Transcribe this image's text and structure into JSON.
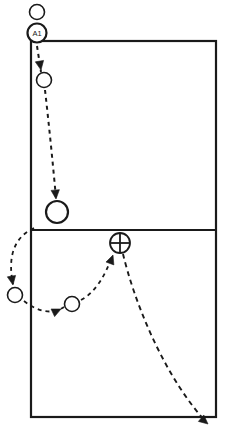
{
  "diagram": {
    "type": "court-play-diagram",
    "colors": {
      "line": "#1a1a1a",
      "fill": "#ffffff",
      "background": "#ffffff"
    },
    "court": {
      "name": "court-outline",
      "left": 31,
      "top": 41,
      "right": 216,
      "bottom": 417,
      "stroke_width": 2.2,
      "net_line_y": 230,
      "net_line_label": ""
    },
    "labels": [
      {
        "name": "player-label-a1",
        "text": "A1",
        "x": 37,
        "y": 33,
        "size": 7.5
      }
    ],
    "markers": [
      {
        "name": "player-start-marker-top",
        "shape": "circle-open",
        "x": 37,
        "y": 12,
        "r": 7.5,
        "stroke_width": 1.6
      },
      {
        "name": "player-marker-a1",
        "shape": "circle-labeled",
        "x": 37,
        "y": 33,
        "r": 9.5,
        "stroke_width": 2.2
      },
      {
        "name": "player-marker-approach-1",
        "shape": "circle-open",
        "x": 44,
        "y": 80,
        "r": 7.5,
        "stroke_width": 1.6
      },
      {
        "name": "player-marker-attack-large",
        "shape": "circle-open",
        "x": 57,
        "y": 212,
        "r": 11,
        "stroke_width": 2.2
      },
      {
        "name": "player-marker-back-left",
        "shape": "circle-open",
        "x": 15,
        "y": 295,
        "r": 7.5,
        "stroke_width": 1.6
      },
      {
        "name": "player-marker-back-mid",
        "shape": "circle-open",
        "x": 72,
        "y": 304,
        "r": 7.5,
        "stroke_width": 1.6
      },
      {
        "name": "ball-contact-marker-crossed-circle",
        "shape": "circle-cross",
        "x": 120,
        "y": 243,
        "r": 10,
        "stroke_width": 1.8
      }
    ],
    "paths": [
      {
        "name": "path-a1-to-approach",
        "d": "M 37 46 L 41 72",
        "dash": "4 4",
        "stroke_width": 2.0,
        "arrow": {
          "x": 41,
          "y": 70,
          "angle": 80
        }
      },
      {
        "name": "path-approach-to-attack",
        "d": "M 45 90 C 49 125, 53 165, 56 198",
        "dash": "4 4",
        "stroke_width": 2.0,
        "arrow": {
          "x": 56,
          "y": 199,
          "angle": 85
        }
      },
      {
        "name": "path-attack-to-back-left",
        "d": "M 34 228 C 12 238, 8 260, 13 284",
        "dash": "4 4",
        "stroke_width": 1.8,
        "arrow": {
          "x": 13,
          "y": 285,
          "angle": 80
        }
      },
      {
        "name": "path-back-left-to-back-mid",
        "d": "M 24 301 C 38 312, 52 315, 64 307",
        "dash": "4 4",
        "stroke_width": 1.8,
        "arrow": {
          "x": 61,
          "y": 309,
          "angle": -25
        }
      },
      {
        "name": "path-back-mid-to-ball",
        "d": "M 81 300 C 96 292, 106 274, 112 256",
        "dash": "4 4",
        "stroke_width": 1.8,
        "arrow": {
          "x": 113,
          "y": 255,
          "angle": -70
        }
      },
      {
        "name": "path-ball-flight-out",
        "d": "M 123 254 C 133 296, 160 370, 205 421",
        "dash": "5 4",
        "stroke_width": 1.9,
        "arrow": {
          "x": 208,
          "y": 424,
          "angle": 40
        }
      }
    ]
  }
}
